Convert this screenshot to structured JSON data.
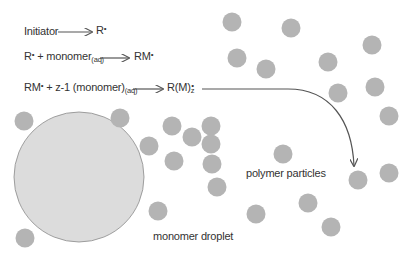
{
  "equations": [
    {
      "lhs": "Initiator",
      "rhs": "R",
      "rhs_sup": "•"
    },
    {
      "lhs": "R",
      "lhs_sup": "•",
      "lhs_rest": " + monomer",
      "lhs_sub": "(aq)",
      "rhs": "RM",
      "rhs_sup": "•"
    },
    {
      "lhs": "RM",
      "lhs_sup": "•",
      "lhs_rest": " + z-1 (monomer)",
      "lhs_sub": "(aq)",
      "rhs": "R(M)",
      "rhs_sub": "z",
      "rhs_sup": "•"
    }
  ],
  "labels": {
    "polymer_particles": "polymer particles",
    "monomer_droplet": "monomer droplet"
  },
  "colors": {
    "particle": "#b4b4b4",
    "droplet_fill": "#dcdcdc",
    "droplet_stroke": "#8a8a8a",
    "text": "#333333",
    "arrow": "#555555"
  },
  "droplet": {
    "cx": 79,
    "cy": 177,
    "r": 65
  },
  "particles": [
    {
      "cx": 232,
      "cy": 22
    },
    {
      "cx": 291,
      "cy": 28
    },
    {
      "cx": 237,
      "cy": 58
    },
    {
      "cx": 266,
      "cy": 69
    },
    {
      "cx": 372,
      "cy": 45
    },
    {
      "cx": 328,
      "cy": 62
    },
    {
      "cx": 375,
      "cy": 87
    },
    {
      "cx": 338,
      "cy": 93
    },
    {
      "cx": 389,
      "cy": 116
    },
    {
      "cx": 211,
      "cy": 126
    },
    {
      "cx": 283,
      "cy": 154
    },
    {
      "cx": 358,
      "cy": 180
    },
    {
      "cx": 389,
      "cy": 173
    },
    {
      "cx": 256,
      "cy": 214
    },
    {
      "cx": 308,
      "cy": 203
    },
    {
      "cx": 331,
      "cy": 227
    },
    {
      "cx": 24,
      "cy": 121
    },
    {
      "cx": 120,
      "cy": 118
    },
    {
      "cx": 172,
      "cy": 126
    },
    {
      "cx": 192,
      "cy": 137
    },
    {
      "cx": 149,
      "cy": 146
    },
    {
      "cx": 174,
      "cy": 161
    },
    {
      "cx": 212,
      "cy": 164
    },
    {
      "cx": 217,
      "cy": 187
    },
    {
      "cx": 158,
      "cy": 211
    },
    {
      "cx": 25,
      "cy": 238
    },
    {
      "cx": 211,
      "cy": 144
    }
  ]
}
